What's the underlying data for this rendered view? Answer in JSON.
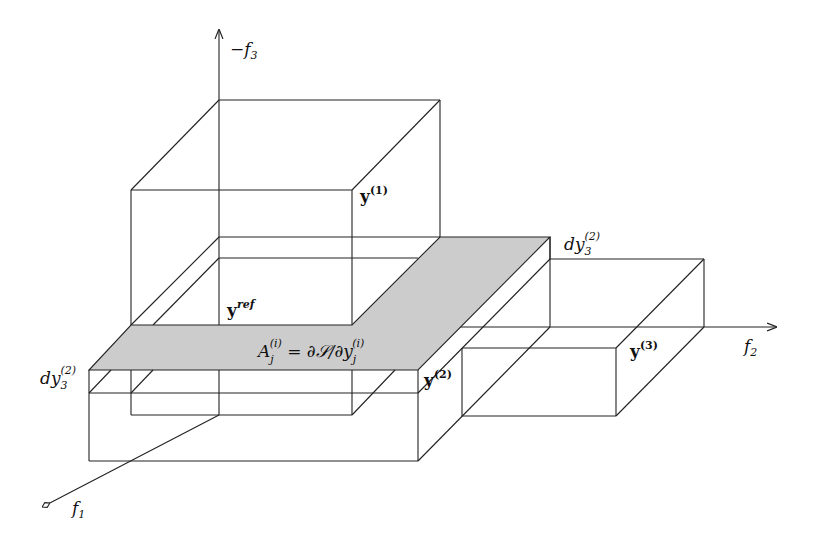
{
  "axes": {
    "vertical": {
      "sign": "−",
      "name": "f",
      "sub": "3"
    },
    "horizontal": {
      "name": "f",
      "sub": "2"
    },
    "depth": {
      "name": "f",
      "sub": "1"
    }
  },
  "points": {
    "y1": {
      "base": "y",
      "sup": "(1)"
    },
    "y2": {
      "base": "y",
      "sup": "(2)"
    },
    "y3": {
      "base": "y",
      "sup": "(3)"
    },
    "yref": {
      "base": "y",
      "sup": "ref"
    }
  },
  "labels": {
    "dy_top": {
      "base": "dy",
      "sub": "3",
      "sup": "(2)"
    },
    "dy_left": {
      "base": "dy",
      "sub": "3",
      "sup": "(2)"
    },
    "formula": {
      "lhs": "A",
      "lhs_sub": "j",
      "lhs_sup": "(i)",
      "mid": " = ∂𝒮/∂y",
      "rhs_sub": "j",
      "rhs_sup": "(i)"
    }
  },
  "colors": {
    "plane": "#cccccc",
    "line": "#222222"
  }
}
